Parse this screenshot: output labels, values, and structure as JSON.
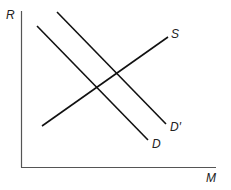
{
  "diagram": {
    "type": "supply-demand",
    "axes": {
      "y_label": "R",
      "x_label": "M",
      "color": "#555555"
    },
    "curves": [
      {
        "id": "D",
        "label": "D",
        "x1": 37,
        "y1": 26,
        "x2": 148,
        "y2": 140,
        "color": "#111111"
      },
      {
        "id": "D_prime",
        "label": "D′",
        "x1": 57,
        "y1": 12,
        "x2": 166,
        "y2": 124,
        "color": "#111111"
      },
      {
        "id": "S",
        "label": "S",
        "x1": 42,
        "y1": 126,
        "x2": 168,
        "y2": 37,
        "color": "#111111"
      }
    ]
  }
}
